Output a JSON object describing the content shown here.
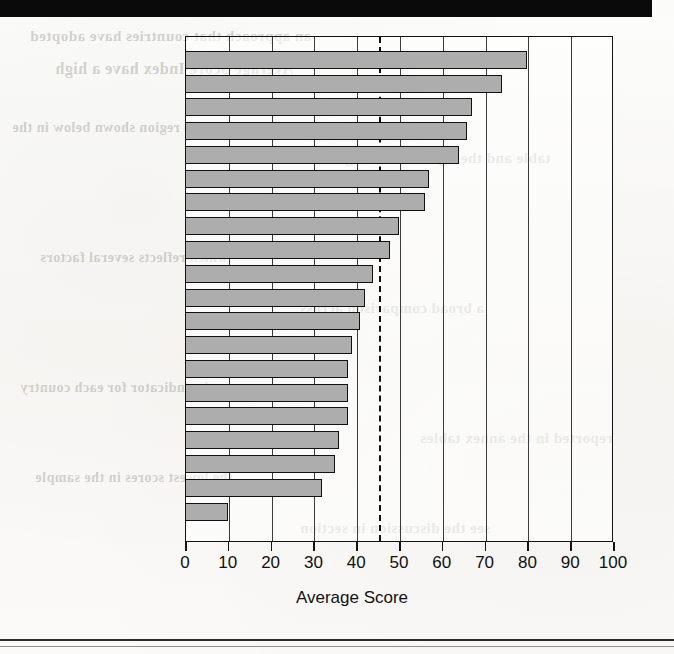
{
  "page": {
    "background_color": "#fbfbf9",
    "top_band_color": "#0a0a0a",
    "rule_color": "#2b2b2b",
    "ghost_text": [
      "an approach that countries have adopted",
      "Average Score Index have a high",
      "in the region shown below in the",
      "table and the figure on the right",
      "which reflects several factors",
      "a broad comparison across",
      "the indicator for each country",
      "reported in the annex tables",
      "the lowest scores in the sample",
      "see the discussion in section"
    ]
  },
  "chart_data": {
    "type": "bar",
    "orientation": "horizontal",
    "title": "",
    "subtitle": "",
    "xlabel": "Average Score",
    "ylabel": "",
    "xlim": [
      0,
      100
    ],
    "xticks": [
      0,
      10,
      20,
      30,
      40,
      50,
      60,
      70,
      80,
      90,
      100
    ],
    "xtick_labels": [
      "0",
      "10",
      "20",
      "30",
      "40",
      "50",
      "60",
      "70",
      "80",
      "90",
      "100"
    ],
    "grid": "vertical",
    "legend": "none",
    "bar_fill_color": "#adadad",
    "bar_edge_color": "#111111",
    "categories": [
      "Uruguay",
      "United States",
      "Chile",
      "Brazil",
      "Argentina",
      "Costa Rica",
      "Mexico",
      "Venezuela",
      "Colombia",
      "Bolivia",
      "Nicaragua",
      "Ecuador",
      "Peru",
      "Honduras",
      "Dominican Rep.",
      "Panama",
      "Paraguay",
      "El Salvador",
      "Guatemala",
      "Haiti"
    ],
    "values": [
      80,
      74,
      67,
      66,
      64,
      57,
      56,
      50,
      48,
      44,
      42,
      41,
      39,
      38,
      38,
      38,
      36,
      35,
      32,
      10
    ],
    "annotations": [
      {
        "type": "reference-line",
        "style": "dashed",
        "orientation": "vertical",
        "value": 45,
        "color": "#101010"
      }
    ]
  }
}
